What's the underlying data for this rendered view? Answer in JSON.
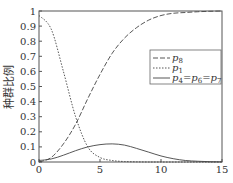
{
  "chart_data": {
    "type": "line",
    "title": "",
    "xlabel": "",
    "ylabel": "种群比例",
    "xlim": [
      0,
      15
    ],
    "ylim": [
      0,
      1
    ],
    "xticks": [
      0,
      5,
      10,
      15
    ],
    "yticks": [
      0,
      0.1,
      0.2,
      0.3,
      0.4,
      0.5,
      0.6,
      0.7,
      0.8,
      0.9,
      1
    ],
    "ytick_labels": [
      "0",
      "0.1",
      "0.2",
      "0.3",
      "0.4",
      "0.5",
      "0.6",
      "0.7",
      "0.8",
      "0.9",
      "1"
    ],
    "grid": false,
    "legend_position": "upper right",
    "x": [
      0,
      1,
      2,
      3,
      4,
      5,
      6,
      7,
      8,
      9,
      10,
      11,
      12,
      13,
      14,
      15
    ],
    "series": [
      {
        "name": "p8",
        "label_main": "p",
        "label_sub": "8",
        "style": "dashed",
        "values": [
          0.0,
          0.03,
          0.12,
          0.25,
          0.42,
          0.58,
          0.72,
          0.82,
          0.89,
          0.94,
          0.97,
          0.985,
          0.99,
          0.995,
          0.998,
          1.0
        ]
      },
      {
        "name": "p1",
        "label_main": "p",
        "label_sub": "1",
        "style": "dotted",
        "values": [
          0.97,
          0.88,
          0.6,
          0.3,
          0.1,
          0.03,
          0.01,
          0.003,
          0.001,
          0.0,
          0.0,
          0.0,
          0.0,
          0.0,
          0.0,
          0.0
        ]
      },
      {
        "name": "p4=p6=p7",
        "label_main": "p",
        "label_sub": "4",
        "label_rest": "=p6=p7",
        "style": "solid",
        "values": [
          0.01,
          0.02,
          0.045,
          0.075,
          0.1,
          0.115,
          0.12,
          0.112,
          0.09,
          0.065,
          0.04,
          0.022,
          0.01,
          0.005,
          0.002,
          0.001
        ]
      }
    ]
  },
  "legend": {
    "items": [
      {
        "main": "p",
        "sub": "8"
      },
      {
        "main": "p",
        "sub": "1"
      },
      {
        "main": "p",
        "sub": "4",
        "eq1": "=p",
        "sub2": "6",
        "eq2": "=p",
        "sub3": "7"
      }
    ]
  }
}
